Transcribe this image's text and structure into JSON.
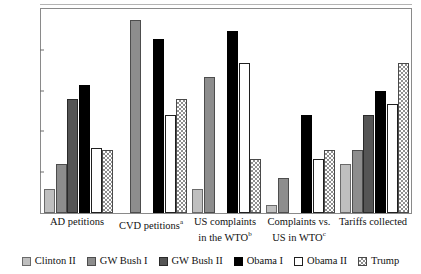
{
  "chart_data": {
    "type": "bar",
    "title": "",
    "xlabel": "",
    "ylabel": "",
    "ylim": [
      0,
      75
    ],
    "yticks": [
      15,
      30,
      45,
      60
    ],
    "ytick_labels": [
      "15",
      "30",
      "45",
      "60"
    ],
    "grid": false,
    "legend_position": "bottom",
    "categories": [
      "AD petitions",
      "CVD petitions",
      "US complaints in the WTO",
      "Complaints vs. US in WTO",
      "Tariffs collected"
    ],
    "category_labels": [
      {
        "line1": "AD petitions",
        "line2": "",
        "sup": ""
      },
      {
        "line1": "CVD petitions",
        "line2": "",
        "sup": "a"
      },
      {
        "line1": "US complaints",
        "line2": "in the WTO",
        "sup": "b"
      },
      {
        "line1": "Complaints vs.",
        "line2": "US in WTO",
        "sup": "c"
      },
      {
        "line1": "Tariffs collected",
        "line2": "",
        "sup": ""
      }
    ],
    "series": [
      {
        "name": "Clinton II",
        "key": "c2",
        "fill": "light-gray",
        "values": [
          9,
          null,
          9,
          3,
          18
        ]
      },
      {
        "name": "GW Bush I",
        "key": "gb1",
        "fill": "medium-gray",
        "values": [
          18,
          71,
          50,
          13,
          23
        ]
      },
      {
        "name": "GW Bush II",
        "key": "gb2",
        "fill": "dark-gray",
        "values": [
          42,
          null,
          null,
          null,
          36
        ]
      },
      {
        "name": "Obama I",
        "key": "ob1",
        "fill": "black",
        "values": [
          47,
          64,
          67,
          36,
          45
        ]
      },
      {
        "name": "Obama II",
        "key": "ob2",
        "fill": "white",
        "values": [
          24,
          36,
          55,
          20,
          40
        ]
      },
      {
        "name": "Trump",
        "key": "tr",
        "fill": "hatched",
        "values": [
          23,
          42,
          20,
          23,
          55
        ]
      }
    ]
  },
  "colors": {
    "clinton_ii": "#bfbfbf",
    "gw_bush_i": "#8d8d8d",
    "gw_bush_ii": "#555555",
    "obama_i": "#000000",
    "obama_ii": "#ffffff",
    "trump": "#8f8f8f",
    "frame": "#8a8a8a",
    "text": "#111111"
  },
  "legend": {
    "items": [
      {
        "label": "Clinton II",
        "key": "c2"
      },
      {
        "label": "GW Bush I",
        "key": "gb1"
      },
      {
        "label": "GW Bush II",
        "key": "gb2"
      },
      {
        "label": "Obama I",
        "key": "ob1"
      },
      {
        "label": "Obama II",
        "key": "ob2"
      },
      {
        "label": "Trump",
        "key": "tr"
      }
    ]
  }
}
